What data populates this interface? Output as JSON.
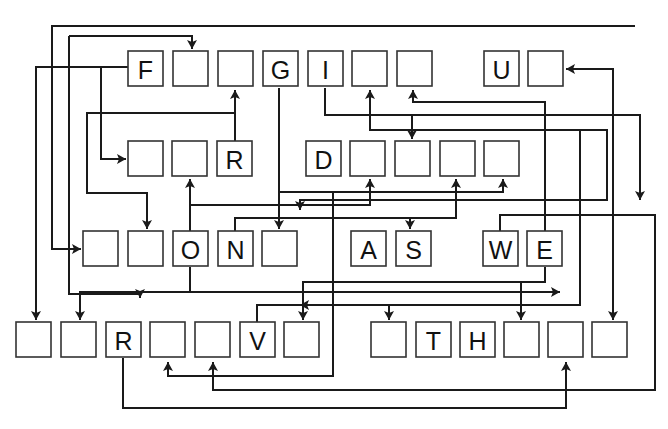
{
  "puzzle": {
    "type": "letter-arrow-cipher",
    "cells": [
      {
        "id": "r1c1",
        "row": 1,
        "letter": "F"
      },
      {
        "id": "r1c2",
        "row": 1,
        "letter": ""
      },
      {
        "id": "r1c3",
        "row": 1,
        "letter": ""
      },
      {
        "id": "r1c4",
        "row": 1,
        "letter": "G"
      },
      {
        "id": "r1c5",
        "row": 1,
        "letter": "I"
      },
      {
        "id": "r1c6",
        "row": 1,
        "letter": ""
      },
      {
        "id": "r1c7",
        "row": 1,
        "letter": ""
      },
      {
        "id": "r1c8",
        "row": 1,
        "letter": "U"
      },
      {
        "id": "r1c9",
        "row": 1,
        "letter": ""
      },
      {
        "id": "r2c1",
        "row": 2,
        "letter": ""
      },
      {
        "id": "r2c2",
        "row": 2,
        "letter": ""
      },
      {
        "id": "r2c3",
        "row": 2,
        "letter": "R"
      },
      {
        "id": "r2c4",
        "row": 2,
        "letter": "D"
      },
      {
        "id": "r2c5",
        "row": 2,
        "letter": ""
      },
      {
        "id": "r2c6",
        "row": 2,
        "letter": ""
      },
      {
        "id": "r2c7",
        "row": 2,
        "letter": ""
      },
      {
        "id": "r2c8",
        "row": 2,
        "letter": ""
      },
      {
        "id": "r3c1",
        "row": 3,
        "letter": ""
      },
      {
        "id": "r3c2",
        "row": 3,
        "letter": ""
      },
      {
        "id": "r3c3",
        "row": 3,
        "letter": "O"
      },
      {
        "id": "r3c4",
        "row": 3,
        "letter": "N"
      },
      {
        "id": "r3c5",
        "row": 3,
        "letter": ""
      },
      {
        "id": "r3c6",
        "row": 3,
        "letter": "A"
      },
      {
        "id": "r3c7",
        "row": 3,
        "letter": "S"
      },
      {
        "id": "r3c8",
        "row": 3,
        "letter": "W"
      },
      {
        "id": "r3c9",
        "row": 3,
        "letter": "E"
      },
      {
        "id": "r4c1",
        "row": 4,
        "letter": ""
      },
      {
        "id": "r4c2",
        "row": 4,
        "letter": ""
      },
      {
        "id": "r4c3",
        "row": 4,
        "letter": "R"
      },
      {
        "id": "r4c4",
        "row": 4,
        "letter": ""
      },
      {
        "id": "r4c5",
        "row": 4,
        "letter": ""
      },
      {
        "id": "r4c6",
        "row": 4,
        "letter": "V"
      },
      {
        "id": "r4c7",
        "row": 4,
        "letter": ""
      },
      {
        "id": "r4c8",
        "row": 4,
        "letter": ""
      },
      {
        "id": "r4c9",
        "row": 4,
        "letter": "T"
      },
      {
        "id": "r4c10",
        "row": 4,
        "letter": "H"
      },
      {
        "id": "r4c11",
        "row": 4,
        "letter": ""
      },
      {
        "id": "r4c12",
        "row": 4,
        "letter": ""
      },
      {
        "id": "r4c13",
        "row": 4,
        "letter": ""
      }
    ],
    "connections": [
      {
        "from": "r1c1",
        "to": "r4c1"
      },
      {
        "from": "r1c1",
        "to": "r2c1"
      },
      {
        "from": "r1c1",
        "to": "r3c2"
      },
      {
        "from": "r2c3",
        "to": "r1c3"
      },
      {
        "from": "r1c4",
        "to": "r3c5"
      },
      {
        "from": "r1c5",
        "to": "r2c6"
      },
      {
        "from": "r3c3",
        "to": "r4c2"
      },
      {
        "from": "r3c3",
        "to": "r2c2"
      },
      {
        "from": "r3c3",
        "to": "r2c5"
      },
      {
        "from": "r3c4",
        "to": "r2c7"
      },
      {
        "from": "r3c4",
        "to": "r3c7"
      },
      {
        "from": "r3c8",
        "to": "r4c5"
      },
      {
        "from": "r3c9",
        "to": "r1c7"
      },
      {
        "from": "r3c9",
        "to": "r4c11"
      },
      {
        "from": "r3c9",
        "to": "r4c7"
      },
      {
        "from": "r4c3",
        "to": "r4c12"
      },
      {
        "from": "r4c6",
        "to": "r1c9"
      },
      {
        "from": "r4c6",
        "to": "r4c13"
      },
      {
        "from": "r2c4",
        "to": "r2c8"
      },
      {
        "from": "r2c4",
        "to": "r4c4"
      }
    ]
  }
}
